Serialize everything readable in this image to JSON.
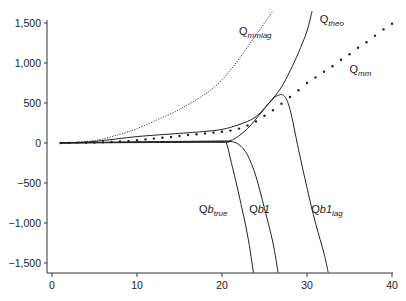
{
  "chart_data": {
    "type": "line",
    "title": "",
    "xlabel": "",
    "ylabel": "",
    "xlim": [
      0,
      40
    ],
    "ylim": [
      -1600,
      1600
    ],
    "grid": false,
    "x_ticks": [
      0,
      10,
      20,
      30,
      40
    ],
    "x_tick_labels": [
      "0",
      "10",
      "20",
      "30",
      "40"
    ],
    "y_ticks": [
      1500,
      1000,
      500,
      0,
      -500,
      -1000,
      -1500
    ],
    "y_tick_labels": [
      "1,500",
      "1,000",
      "500",
      "0",
      "−500",
      "−1,000",
      "−1,500"
    ],
    "series": [
      {
        "name": "Q_mmlag",
        "label_main": "Q",
        "label_sub": "mmlag",
        "style": "fine-dotted",
        "points": [
          [
            1,
            0
          ],
          [
            5,
            30
          ],
          [
            8,
            110
          ],
          [
            10,
            180
          ],
          [
            13,
            320
          ],
          [
            15,
            420
          ],
          [
            18,
            610
          ],
          [
            20,
            790
          ],
          [
            22,
            1050
          ],
          [
            24,
            1350
          ],
          [
            26,
            1650
          ]
        ]
      },
      {
        "name": "Q_theo",
        "label_main": "Q",
        "label_sub": "theo",
        "style": "solid",
        "points": [
          [
            1,
            0
          ],
          [
            5,
            20
          ],
          [
            10,
            80
          ],
          [
            15,
            120
          ],
          [
            18,
            145
          ],
          [
            20,
            170
          ],
          [
            22,
            230
          ],
          [
            24,
            330
          ],
          [
            26,
            560
          ],
          [
            27,
            700
          ],
          [
            28,
            900
          ],
          [
            29,
            1130
          ],
          [
            30,
            1400
          ],
          [
            30.6,
            1650
          ]
        ]
      },
      {
        "name": "Q_mm",
        "label_main": "Q",
        "label_sub": "mm",
        "style": "dots",
        "points": [
          [
            1,
            0
          ],
          [
            2,
            1
          ],
          [
            3,
            2
          ],
          [
            4,
            4
          ],
          [
            5,
            6
          ],
          [
            6,
            9
          ],
          [
            7,
            13
          ],
          [
            8,
            18
          ],
          [
            9,
            25
          ],
          [
            10,
            35
          ],
          [
            11,
            45
          ],
          [
            12,
            55
          ],
          [
            13,
            65
          ],
          [
            14,
            75
          ],
          [
            15,
            88
          ],
          [
            16,
            100
          ],
          [
            17,
            110
          ],
          [
            18,
            120
          ],
          [
            19,
            130
          ],
          [
            20,
            140
          ],
          [
            21,
            155
          ],
          [
            22,
            180
          ],
          [
            23,
            220
          ],
          [
            24,
            270
          ],
          [
            25,
            340
          ],
          [
            26,
            410
          ],
          [
            27,
            490
          ],
          [
            28,
            575
          ],
          [
            29,
            660
          ],
          [
            30,
            750
          ],
          [
            31,
            820
          ],
          [
            32,
            890
          ],
          [
            33,
            960
          ],
          [
            34,
            1040
          ],
          [
            35,
            1110
          ],
          [
            36,
            1190
          ],
          [
            37,
            1260
          ],
          [
            38,
            1340
          ],
          [
            39,
            1420
          ],
          [
            40,
            1490
          ]
        ]
      },
      {
        "name": "Qb_true",
        "label_main": "Qb",
        "label_sub": "true",
        "style": "solid",
        "points": [
          [
            1,
            0
          ],
          [
            10,
            5
          ],
          [
            20,
            8
          ],
          [
            20.5,
            0
          ],
          [
            21,
            -200
          ],
          [
            22,
            -650
          ],
          [
            23,
            -1150
          ],
          [
            23.7,
            -1620
          ]
        ]
      },
      {
        "name": "Qb1",
        "label_main": "Qb1",
        "label_sub": "",
        "style": "solid",
        "points": [
          [
            1,
            0
          ],
          [
            10,
            10
          ],
          [
            20,
            20
          ],
          [
            21,
            20
          ],
          [
            22,
            -20
          ],
          [
            23,
            -150
          ],
          [
            24,
            -420
          ],
          [
            25,
            -820
          ],
          [
            26,
            -1250
          ],
          [
            26.6,
            -1620
          ]
        ]
      },
      {
        "name": "Qb1_lag",
        "label_main": "Qb1",
        "label_sub": "lag",
        "style": "solid",
        "points": [
          [
            1,
            0
          ],
          [
            10,
            15
          ],
          [
            20,
            25
          ],
          [
            21,
            30
          ],
          [
            22,
            90
          ],
          [
            23,
            180
          ],
          [
            24,
            300
          ],
          [
            25,
            430
          ],
          [
            26,
            550
          ],
          [
            26.6,
            595
          ],
          [
            27.3,
            590
          ],
          [
            28,
            420
          ],
          [
            29,
            -80
          ],
          [
            30,
            -560
          ],
          [
            31,
            -1000
          ],
          [
            32,
            -1380
          ],
          [
            32.5,
            -1620
          ]
        ]
      }
    ],
    "annotations": [
      {
        "text": "Q_mmlag",
        "x": 22,
        "y": 1350
      },
      {
        "text": "Q_theo",
        "x": 31.5,
        "y": 1500
      },
      {
        "text": "Q_mm",
        "x": 35,
        "y": 870
      },
      {
        "text": "Qb_true",
        "x": 17.3,
        "y": -880
      },
      {
        "text": "Qb1",
        "x": 23.2,
        "y": -880
      },
      {
        "text": "Qb1_lag",
        "x": 30.5,
        "y": -880
      }
    ]
  }
}
